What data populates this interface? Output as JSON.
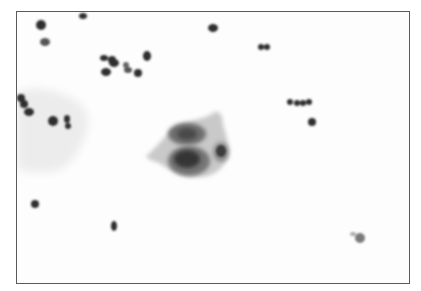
{
  "image": {
    "description": "Grayscale cytology micrograph: central squamous epithelial cell cluster with enlarged nuclei, scattered neutrophils, and a faint squamous cell at left",
    "frame_color": "#5a5a5a",
    "background_color": "#fdfdfd",
    "nucleus_color": "#2e2e2e",
    "cytoplasm_color": "#b9b9b9"
  }
}
